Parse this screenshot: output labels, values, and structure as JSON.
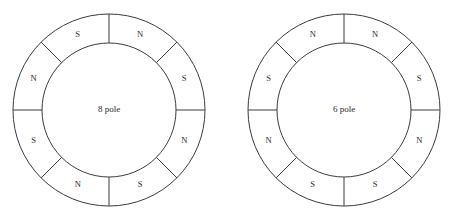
{
  "figure": {
    "background_color": "#ffffff",
    "line_color": "#3c3c3c",
    "text_color": "#2b2b2b"
  },
  "chart_data": {
    "type": "diagram",
    "title": "",
    "subtitle": "",
    "xlabel": "",
    "ylabel": "",
    "legend_position": "none",
    "grid": false,
    "diagrams": [
      {
        "id": "left-diagram",
        "center_label": "8 pole",
        "center_x": 109,
        "center_y": 110,
        "outer_radius": 96,
        "inner_radius": 67,
        "segment_count": 8,
        "segment_span_degrees": 45,
        "start_angle_degrees": -90,
        "label_radius": 81.5,
        "segments": [
          {
            "index": 0,
            "label": "N",
            "start_deg": -90,
            "end_deg": -45,
            "mid_deg": -67.5
          },
          {
            "index": 1,
            "label": "S",
            "start_deg": -45,
            "end_deg": 0,
            "mid_deg": -22.5
          },
          {
            "index": 2,
            "label": "N",
            "start_deg": 0,
            "end_deg": 45,
            "mid_deg": 22.5
          },
          {
            "index": 3,
            "label": "S",
            "start_deg": 45,
            "end_deg": 90,
            "mid_deg": 67.5
          },
          {
            "index": 4,
            "label": "N",
            "start_deg": 90,
            "end_deg": 135,
            "mid_deg": 112.5
          },
          {
            "index": 5,
            "label": "S",
            "start_deg": 135,
            "end_deg": 180,
            "mid_deg": 157.5
          },
          {
            "index": 6,
            "label": "N",
            "start_deg": 180,
            "end_deg": 225,
            "mid_deg": 202.5
          },
          {
            "index": 7,
            "label": "S",
            "start_deg": 225,
            "end_deg": 270,
            "mid_deg": 247.5
          }
        ]
      },
      {
        "id": "right-diagram",
        "center_label": "6 pole",
        "center_x": 344,
        "center_y": 110,
        "outer_radius": 96,
        "inner_radius": 67,
        "segment_count": 8,
        "segment_span_degrees": 45,
        "start_angle_degrees": -90,
        "label_radius": 81.5,
        "segments": [
          {
            "index": 0,
            "label": "N",
            "start_deg": -90,
            "end_deg": -45,
            "mid_deg": -67.5
          },
          {
            "index": 1,
            "label": "S",
            "start_deg": -45,
            "end_deg": 0,
            "mid_deg": -22.5
          },
          {
            "index": 2,
            "label": "N",
            "start_deg": 0,
            "end_deg": 45,
            "mid_deg": 22.5
          },
          {
            "index": 3,
            "label": "S",
            "start_deg": 45,
            "end_deg": 90,
            "mid_deg": 67.5
          },
          {
            "index": 4,
            "label": "S",
            "start_deg": 90,
            "end_deg": 135,
            "mid_deg": 112.5
          },
          {
            "index": 5,
            "label": "N",
            "start_deg": 135,
            "end_deg": 180,
            "mid_deg": 157.5
          },
          {
            "index": 6,
            "label": "S",
            "start_deg": 180,
            "end_deg": 225,
            "mid_deg": 202.5
          },
          {
            "index": 7,
            "label": "N",
            "start_deg": 225,
            "end_deg": 270,
            "mid_deg": 247.5
          }
        ]
      }
    ]
  }
}
